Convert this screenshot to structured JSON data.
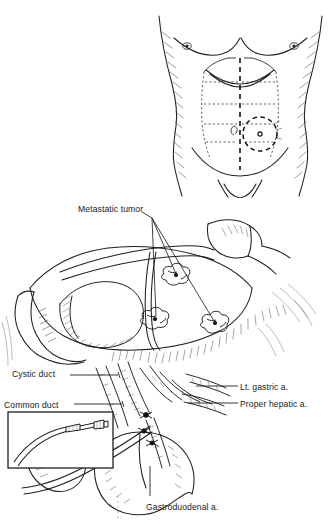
{
  "figure": {
    "type": "medical-illustration",
    "style": "pen-and-ink line drawing",
    "panels": [
      {
        "id": "torso-panel",
        "name": "abdominal-wall-incision-diagram",
        "description": "Anterior view of male torso with dashed midline laparotomy incision and dashed circle marking subcutaneous port site"
      },
      {
        "id": "operative-panel",
        "name": "hepatic-artery-catheter-placement",
        "description": "Intraoperative view of liver, gallbladder and hepatoduodenal ligament with catheter in gastroduodenal artery"
      }
    ]
  },
  "labels": {
    "metastatic_tumor": "Metastatic tumor",
    "cystic_duct": "Cystic duct",
    "common_duct": "Common duct",
    "lt_gastric_a": "Lt. gastric a.",
    "proper_hepatic_a": "Proper hepatic a.",
    "gastroduodenal_a": "Gastroduodenal a."
  },
  "colors": {
    "background": "#ffffff",
    "ink": "#1a1a1a",
    "line": "#222222",
    "hatch": "#555555",
    "text": "#1a1a1a"
  },
  "inset": {
    "name": "catheter-detail-inset",
    "description": "Rectangular inset showing catheter tubing with connector hub"
  }
}
